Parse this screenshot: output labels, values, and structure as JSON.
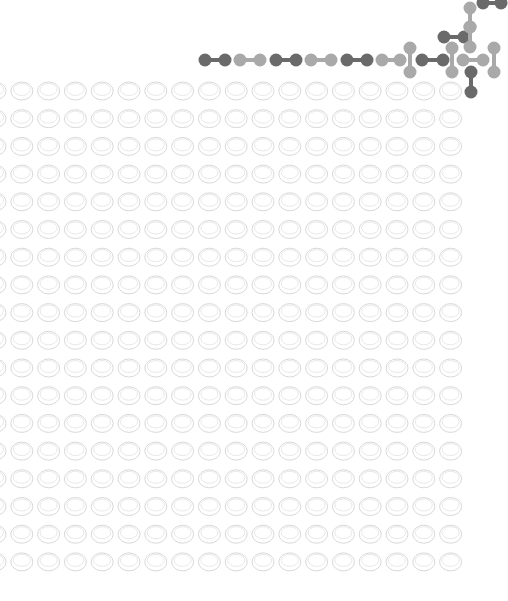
{
  "canvas": {
    "width": 508,
    "height": 601,
    "background": "#ffffff"
  },
  "colors": {
    "dark_atom": "#6a6a6a",
    "light_atom": "#a9a9a9",
    "oval_stroke": "#d4d4d4",
    "oval_inner_stroke": "#e2e2e2"
  },
  "oval_grid": {
    "rows": 18,
    "columns": 18,
    "first_center_x": -5,
    "first_center_y": 91,
    "pitch_x": 26.8,
    "pitch_y": 27.7,
    "oval_rx": 11,
    "oval_ry": 9
  },
  "molecules": [
    {
      "type": "horizontal",
      "shade": "dark",
      "x1": 205,
      "y1": 60,
      "x2": 225,
      "y2": 60
    },
    {
      "type": "horizontal",
      "shade": "light",
      "x1": 240,
      "y1": 60,
      "x2": 260,
      "y2": 60
    },
    {
      "type": "horizontal",
      "shade": "dark",
      "x1": 276,
      "y1": 60,
      "x2": 296,
      "y2": 60
    },
    {
      "type": "horizontal",
      "shade": "light",
      "x1": 311,
      "y1": 60,
      "x2": 331,
      "y2": 60
    },
    {
      "type": "horizontal",
      "shade": "dark",
      "x1": 347,
      "y1": 60,
      "x2": 367,
      "y2": 60
    },
    {
      "type": "horizontal",
      "shade": "light",
      "x1": 382,
      "y1": 60,
      "x2": 400,
      "y2": 60
    },
    {
      "type": "vertical",
      "shade": "light",
      "x1": 410,
      "y1": 48,
      "x2": 410,
      "y2": 72
    },
    {
      "type": "horizontal",
      "shade": "dark",
      "x1": 422,
      "y1": 60,
      "x2": 443,
      "y2": 60
    },
    {
      "type": "vertical",
      "shade": "light",
      "x1": 452,
      "y1": 48,
      "x2": 452,
      "y2": 72
    },
    {
      "type": "horizontal",
      "shade": "dark",
      "x1": 444,
      "y1": 37,
      "x2": 464,
      "y2": 37
    },
    {
      "type": "vertical",
      "shade": "light",
      "x1": 470,
      "y1": 8,
      "x2": 470,
      "y2": 27
    },
    {
      "type": "vertical",
      "shade": "light",
      "x1": 470,
      "y1": 27,
      "x2": 470,
      "y2": 47
    },
    {
      "type": "horizontal",
      "shade": "dark",
      "x1": 483,
      "y1": 3,
      "x2": 501,
      "y2": 3
    },
    {
      "type": "horizontal",
      "shade": "light",
      "x1": 463,
      "y1": 60,
      "x2": 483,
      "y2": 60
    },
    {
      "type": "vertical",
      "shade": "light",
      "x1": 494,
      "y1": 48,
      "x2": 494,
      "y2": 72
    },
    {
      "type": "vertical",
      "shade": "dark",
      "x1": 471,
      "y1": 72,
      "x2": 471,
      "y2": 92
    }
  ]
}
